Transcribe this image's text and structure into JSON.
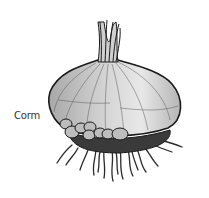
{
  "figure": {
    "label": "Corm",
    "colors": {
      "background": "#ffffff",
      "outline": "#1a1a1a",
      "bulb_fill": "#c9c9c9",
      "bulb_highlight": "#e6e6e6",
      "cormel_fill": "#bdbdbd",
      "basal_plate": "#3a3a3a",
      "roots": "#2a2a2a",
      "label_text": "#333333"
    }
  }
}
